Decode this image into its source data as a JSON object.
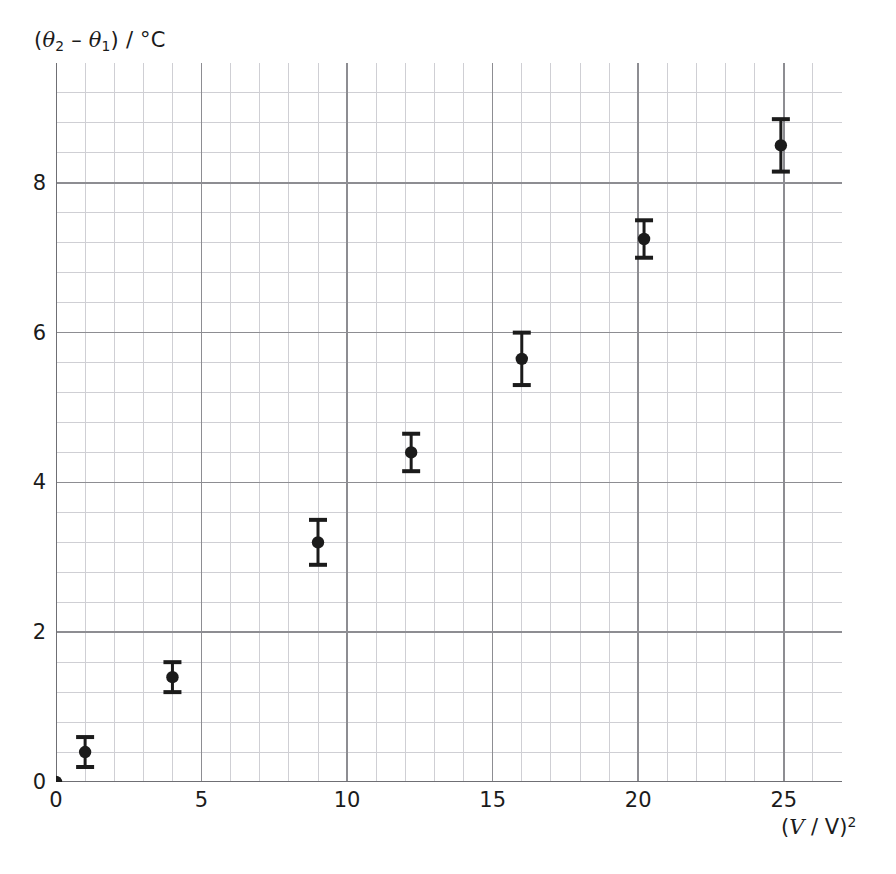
{
  "figure": {
    "width": 896,
    "height": 874,
    "background": "#ffffff",
    "ink_color": "#1b1b1b",
    "grid_minor_color": "#cfcfd4",
    "grid_major_color": "#8d8d92",
    "axis_color": "#6f6f74"
  },
  "axis_labels": {
    "y_prefix": "(",
    "y_theta": "θ",
    "y_sub2": "2",
    "y_minus": " – ",
    "y_theta1": "θ",
    "y_sub1": "1",
    "y_suffix": ") / °C",
    "y_full": "(θ2 – θ1) / °C",
    "x_open": "(",
    "x_v1": "V",
    "x_slash": " / ",
    "x_v2": "V",
    "x_close": ")",
    "x_exp": "2",
    "x_full": "(V / V)2"
  },
  "chart_data": {
    "type": "scatter",
    "title": "",
    "xlabel": "(V / V)^2",
    "ylabel": "(theta_2 - theta_1) / degC",
    "xlim": [
      0,
      27
    ],
    "ylim": [
      0,
      9.6
    ],
    "xticks": [
      0,
      5,
      10,
      15,
      20,
      25
    ],
    "yticks": [
      0,
      2,
      4,
      6,
      8
    ],
    "xtick_labels": [
      "0",
      "5",
      "10",
      "15",
      "20",
      "25"
    ],
    "ytick_labels": [
      "0",
      "2",
      "4",
      "6",
      "8"
    ],
    "grid": "major-and-minor",
    "minor_step_x": 1,
    "minor_step_y": 0.4,
    "major_step_x": 5,
    "major_step_y": 2,
    "legend": "none",
    "error_bars": "y-only with caps",
    "marker": "filled-circle",
    "points": [
      {
        "x": 0.0,
        "y": 0.0,
        "yerr": 0.0,
        "label": "origin"
      },
      {
        "x": 1.0,
        "y": 0.4,
        "yerr": 0.2,
        "label": "p1"
      },
      {
        "x": 4.0,
        "y": 1.4,
        "yerr": 0.2,
        "label": "p2"
      },
      {
        "x": 9.0,
        "y": 3.2,
        "yerr": 0.3,
        "label": "p3"
      },
      {
        "x": 12.2,
        "y": 4.4,
        "yerr": 0.25,
        "label": "p4"
      },
      {
        "x": 16.0,
        "y": 5.65,
        "yerr": 0.35,
        "label": "p5"
      },
      {
        "x": 20.2,
        "y": 7.25,
        "yerr": 0.25,
        "label": "p6"
      },
      {
        "x": 24.9,
        "y": 8.5,
        "yerr": 0.35,
        "label": "p7"
      }
    ]
  }
}
